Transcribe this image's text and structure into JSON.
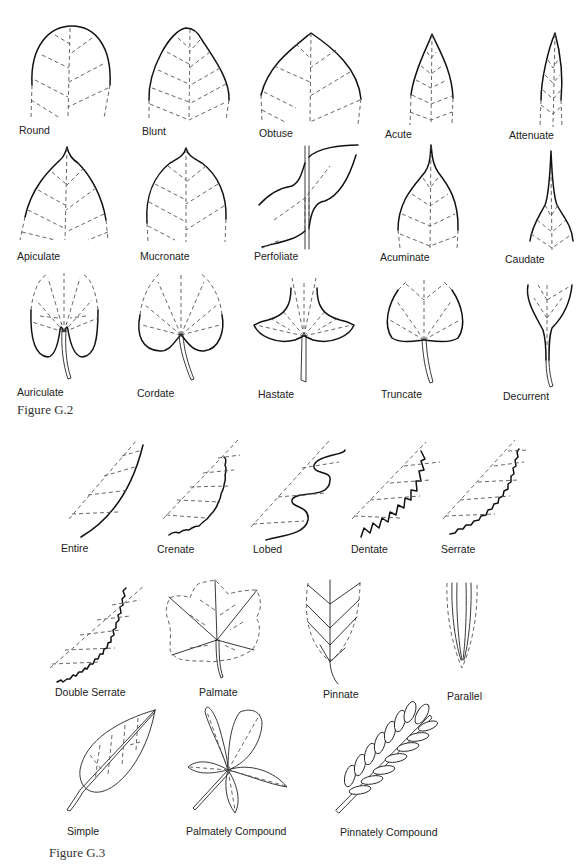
{
  "figure_g2": {
    "caption": "Figure G.2",
    "topic": "leaf tips and bases",
    "row1": [
      {
        "label": "Round",
        "icon": "round-leaf-tip-icon"
      },
      {
        "label": "Blunt",
        "icon": "blunt-leaf-tip-icon"
      },
      {
        "label": "Obtuse",
        "icon": "obtuse-leaf-tip-icon"
      },
      {
        "label": "Acute",
        "icon": "acute-leaf-tip-icon"
      },
      {
        "label": "Attenuate",
        "icon": "attenuate-leaf-tip-icon"
      }
    ],
    "row2": [
      {
        "label": "Apiculate",
        "icon": "apiculate-leaf-tip-icon"
      },
      {
        "label": "Mucronate",
        "icon": "mucronate-leaf-tip-icon"
      },
      {
        "label": "Perfoliate",
        "icon": "perfoliate-leaf-icon"
      },
      {
        "label": "Acuminate",
        "icon": "acuminate-leaf-tip-icon"
      },
      {
        "label": "Caudate",
        "icon": "caudate-leaf-tip-icon"
      }
    ],
    "row3": [
      {
        "label": "Auriculate",
        "icon": "auriculate-leaf-base-icon"
      },
      {
        "label": "Cordate",
        "icon": "cordate-leaf-base-icon"
      },
      {
        "label": "Hastate",
        "icon": "hastate-leaf-base-icon"
      },
      {
        "label": "Truncate",
        "icon": "truncate-leaf-base-icon"
      },
      {
        "label": "Decurrent",
        "icon": "decurrent-leaf-base-icon"
      }
    ]
  },
  "figure_g3": {
    "caption": "Figure G.3",
    "topic": "leaf margins, venation and arrangement",
    "margins": [
      {
        "label": "Entire",
        "icon": "entire-margin-icon"
      },
      {
        "label": "Crenate",
        "icon": "crenate-margin-icon"
      },
      {
        "label": "Lobed",
        "icon": "lobed-margin-icon"
      },
      {
        "label": "Dentate",
        "icon": "dentate-margin-icon"
      },
      {
        "label": "Serrate",
        "icon": "serrate-margin-icon"
      }
    ],
    "venation": [
      {
        "label": "Double Serrate",
        "icon": "double-serrate-margin-icon"
      },
      {
        "label": "Palmate",
        "icon": "palmate-venation-icon"
      },
      {
        "label": "Pinnate",
        "icon": "pinnate-venation-icon"
      },
      {
        "label": "Parallel",
        "icon": "parallel-venation-icon"
      }
    ],
    "types": [
      {
        "label": "Simple",
        "icon": "simple-leaf-icon"
      },
      {
        "label": "Palmately Compound",
        "icon": "palmately-compound-leaf-icon"
      },
      {
        "label": "Pinnately Compound",
        "icon": "pinnately-compound-leaf-icon"
      }
    ]
  }
}
